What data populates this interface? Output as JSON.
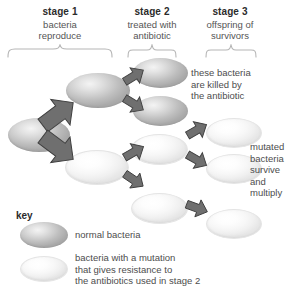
{
  "stages": [
    {
      "id": "stage1",
      "title": "stage 1",
      "subtitle": "bacteria\nreproduce"
    },
    {
      "id": "stage2",
      "title": "stage 2",
      "subtitle": "treated with\nantibiotic"
    },
    {
      "id": "stage3",
      "title": "stage 3",
      "subtitle": "offspring of\nsurvivors"
    }
  ],
  "annotations": [
    {
      "id": "killed",
      "text": "these bacteria\nare killed by\nthe antibiotic"
    },
    {
      "id": "survive",
      "text": "mutated\nbacteria\nsurvive\nand\nmultiply"
    }
  ],
  "key": {
    "label": "key",
    "entries": [
      {
        "id": "normal",
        "swatch": "normal-bacteria-oval",
        "text": "normal bacteria"
      },
      {
        "id": "mutant",
        "swatch": "mutant-bacteria-oval",
        "text": "bacteria with a mutation\nthat gives resistance to\nthe antibiotics used in stage 2"
      }
    ]
  },
  "colors": {
    "normal_bacteria": "#c6c6c6",
    "mutant_bacteria": "#f7f7f7",
    "arrow": "#6b6b6b",
    "bracket": "#b5b5b5",
    "text": "#4d4d4d",
    "heading": "#2b2b2b",
    "background": "#ffffff"
  },
  "cells": [
    {
      "id": "ancestor",
      "type": "normal",
      "stage": 1
    },
    {
      "id": "s1-top",
      "type": "normal",
      "stage": 1
    },
    {
      "id": "s1-bottom",
      "type": "mutant",
      "stage": 1
    },
    {
      "id": "s2-a",
      "type": "normal",
      "stage": 2
    },
    {
      "id": "s2-b",
      "type": "normal",
      "stage": 2
    },
    {
      "id": "s2-c",
      "type": "mutant",
      "stage": 2
    },
    {
      "id": "s2-d",
      "type": "mutant",
      "stage": 2
    },
    {
      "id": "s3-a",
      "type": "mutant",
      "stage": 3
    },
    {
      "id": "s3-b",
      "type": "mutant",
      "stage": 3
    },
    {
      "id": "s3-c",
      "type": "mutant",
      "stage": 3
    }
  ]
}
